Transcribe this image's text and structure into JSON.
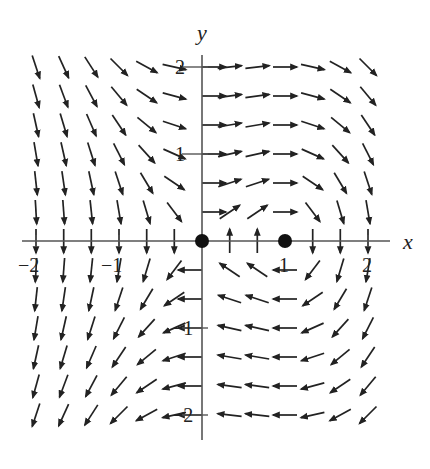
{
  "figure": {
    "type": "direction_field",
    "axis_labels": {
      "x": "x",
      "y": "y"
    },
    "x_ticks": [
      {
        "value": -2,
        "label": "−2"
      },
      {
        "value": -1,
        "label": "−1"
      },
      {
        "value": 1,
        "label": "1"
      },
      {
        "value": 2,
        "label": "2"
      }
    ],
    "y_ticks": [
      {
        "value": 2,
        "label": "2"
      },
      {
        "value": 1,
        "label": "1"
      },
      {
        "value": -1,
        "label": "−1"
      },
      {
        "value": -2,
        "label": "−2"
      }
    ],
    "equilibrium_points": [
      {
        "x": 0,
        "y": 0
      },
      {
        "x": 1,
        "y": 0
      }
    ],
    "grid": {
      "xmin": -2,
      "xmax": 2,
      "ymin": -2,
      "ymax": 2,
      "step": 0.3333
    },
    "field": {
      "dx": "y",
      "dy": "x - x^2"
    },
    "colors": {
      "arrow": "#222222",
      "axis": "#555555",
      "dot": "#111111"
    }
  }
}
